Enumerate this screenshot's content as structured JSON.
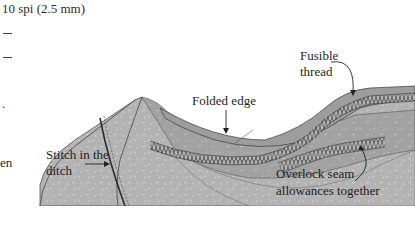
{
  "page_text": {
    "spec_line": "10 spi (2.5 mm)",
    "dash_1": "—",
    "dash_2": "—",
    "fragment_period": ".",
    "fragment_word": "en"
  },
  "diagram": {
    "labels": {
      "fusible_thread_1": "Fusible",
      "fusible_thread_2": "thread",
      "folded_edge": "Folded edge",
      "stitch_in_ditch_1": "Stitch in the",
      "stitch_in_ditch_2": "ditch",
      "overlock_1": "Overlock seam",
      "overlock_2": "allowances together"
    },
    "colors": {
      "fabric_light": "#b9b9b9",
      "fabric_mid": "#a6a6a6",
      "fabric_dark": "#8f8f8f",
      "stitching": "#555555",
      "outline": "#3a3a3a",
      "text": "#222222"
    }
  }
}
